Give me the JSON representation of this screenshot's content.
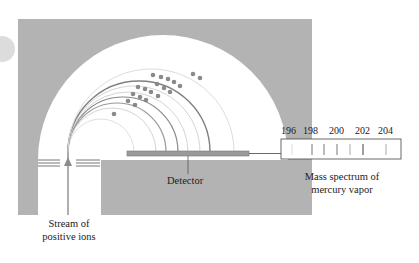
{
  "diagram": {
    "labels": {
      "stream": [
        "Stream of",
        "positive ions"
      ],
      "detector": "Detector",
      "spectrum": [
        "Mass spectrum of",
        "mercury vapor"
      ]
    },
    "spectrum_ticks": [
      "196",
      "198",
      "200",
      "202",
      "204"
    ],
    "spectrum_lines_x": [
      292,
      312,
      324,
      337,
      350,
      363,
      386
    ],
    "colors": {
      "housing": "#b3b3b3",
      "chamber": "#ffffff",
      "ion_path": "#8c8c8c",
      "ion_path_light": "#d4d4d4",
      "ion_dot": "#8a8a8a",
      "detector": "#9a9a9a",
      "spectrum_line": "#777777"
    }
  }
}
